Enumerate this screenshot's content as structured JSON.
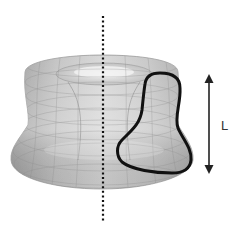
{
  "figure": {
    "axis": {
      "style": "dotted",
      "color": "#111111"
    },
    "surface": {
      "fill": "#bdbdbd",
      "mesh_color": "#8a8a8a",
      "highlight": "#eeeeee"
    },
    "profile": {
      "stroke": "#111111",
      "stroke_width": 3
    },
    "dimension": {
      "label": "L",
      "color": "#222222"
    }
  }
}
